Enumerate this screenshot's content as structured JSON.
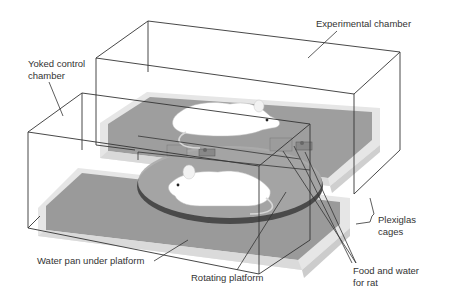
{
  "figure": {
    "type": "apparatus diagram",
    "colors": {
      "background": "#ffffff",
      "outline": "#333333",
      "water": "#9a9a9a",
      "pan_rim": "#e2e2e2",
      "platform": "#a8a8a8",
      "platform_edge": "#4a4a4a",
      "rat": "#ffffff",
      "label_text": "#333333"
    }
  },
  "labels": {
    "experimental_chamber": "Experimental chamber",
    "yoked_control_chamber": "Yoked control\nchamber",
    "plexiglas_cages": "Plexiglas\ncages",
    "water_pan": "Water pan under platform",
    "rotating_platform": "Rotating platform",
    "food_water": "Food and water\nfor rat"
  },
  "components": [
    {
      "id": "experimental-chamber",
      "description": "Rear transparent box containing one rat"
    },
    {
      "id": "yoked-control-chamber",
      "description": "Front transparent box containing second rat"
    },
    {
      "id": "rotating-platform",
      "description": "Shared circular disc spanning both chambers"
    },
    {
      "id": "water-pan",
      "description": "Gray water-filled pans beneath each chamber"
    },
    {
      "id": "food-water-dispensers",
      "description": "Small feeders at the edge of each chamber"
    },
    {
      "id": "rat-experimental",
      "description": "White rat in rear chamber"
    },
    {
      "id": "rat-control",
      "description": "White rat in front chamber"
    }
  ]
}
